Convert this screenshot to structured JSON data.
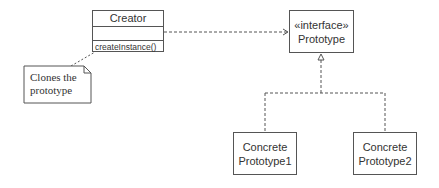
{
  "diagram": {
    "type": "UML class diagram",
    "pattern": "Prototype",
    "creator": {
      "name": "Creator",
      "attributes": [],
      "operations": [
        "createInstance()"
      ]
    },
    "prototype": {
      "stereotype": "«interface»",
      "name": "Prototype"
    },
    "concrete1": {
      "line1": "Concrete",
      "line2": "Prototype1"
    },
    "concrete2": {
      "line1": "Concrete",
      "line2": "Prototype2"
    },
    "note": {
      "line1": "Clones the",
      "line2": "prototype"
    },
    "relationships": [
      {
        "from": "Creator",
        "to": "Prototype",
        "kind": "dependency"
      },
      {
        "from": "ConcretePrototype1",
        "to": "Prototype",
        "kind": "realization"
      },
      {
        "from": "ConcretePrototype2",
        "to": "Prototype",
        "kind": "realization"
      },
      {
        "from": "Note",
        "to": "Creator",
        "kind": "anchor"
      }
    ],
    "colors": {
      "stroke": "#555555",
      "text": "#333333",
      "background": "#ffffff"
    }
  }
}
